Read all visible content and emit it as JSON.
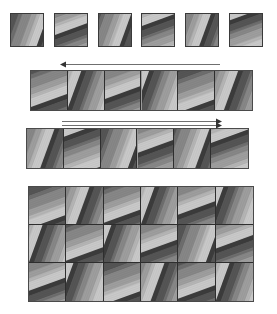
{
  "figure": {
    "background_color": "#ffffff",
    "canvas": {
      "width": 277,
      "height": 314
    },
    "palette": {
      "tile_base": "#8a8a8a",
      "stripe_darkest": "#3c3c3c",
      "stripe_dark": "#555555",
      "stripe_mid_dark": "#6e6e6e",
      "stripe_mid": "#878787",
      "stripe_mid_light": "#9e9e9e",
      "stripe_light": "#b5b5b5",
      "stripe_lightest": "#c9c9c9",
      "tile_border": "#3a3a3a",
      "strip_border": "#4a4a4a",
      "cell_divider": "#2e2e2e",
      "arrow_color": "#6f6f6f"
    },
    "tile_orientations": {
      "shallow_label": "shallow-diagonal",
      "shallow_angle_deg": 20,
      "steep_label": "steep-diagonal",
      "steep_angle_deg": 70
    }
  },
  "rows": [
    {
      "name": "separate-tiles-row",
      "kind": "separate",
      "y": 13,
      "tile_size": 34,
      "count": 6,
      "x_positions": [
        10,
        54,
        98,
        141,
        185,
        229
      ],
      "orientations": [
        "shallow",
        "steep",
        "shallow",
        "steep",
        "shallow",
        "steep"
      ],
      "shade_offsets": [
        0,
        3,
        1,
        4,
        2,
        5
      ]
    },
    {
      "name": "strip-row-upper",
      "kind": "strip",
      "x": 30,
      "y": 70,
      "width": 223,
      "height": 41,
      "count": 6,
      "orientations": [
        "steep",
        "shallow",
        "steep",
        "shallow",
        "steep",
        "shallow"
      ],
      "shade_offsets": [
        1,
        4,
        2,
        5,
        0,
        3
      ]
    },
    {
      "name": "strip-row-lower",
      "kind": "strip",
      "x": 26,
      "y": 128,
      "width": 223,
      "height": 41,
      "count": 6,
      "orientations": [
        "shallow",
        "steep",
        "shallow",
        "steep",
        "shallow",
        "steep"
      ],
      "shade_offsets": [
        2,
        5,
        0,
        3,
        1,
        4
      ]
    },
    {
      "name": "grid-block",
      "kind": "grid",
      "x": 28,
      "y": 186,
      "width": 226,
      "height": 116,
      "cols": 6,
      "grid_rows": 3,
      "orientations": [
        [
          "steep",
          "shallow",
          "steep",
          "shallow",
          "steep",
          "shallow"
        ],
        [
          "shallow",
          "steep",
          "shallow",
          "steep",
          "shallow",
          "steep"
        ],
        [
          "steep",
          "shallow",
          "steep",
          "shallow",
          "steep",
          "shallow"
        ]
      ],
      "shade_offsets": [
        [
          0,
          3,
          1,
          4,
          2,
          5
        ],
        [
          4,
          1,
          5,
          2,
          0,
          3
        ],
        [
          2,
          5,
          0,
          3,
          1,
          4
        ]
      ]
    }
  ],
  "arrows": [
    {
      "name": "arrow-left-above-upper-strip",
      "direction": "left",
      "x": 60,
      "y": 60,
      "length": 160
    },
    {
      "name": "arrow-right-below-upper-strip",
      "direction": "right",
      "x": 62,
      "y": 117,
      "length": 160
    },
    {
      "name": "arrow-right-above-lower-strip",
      "direction": "right",
      "x": 62,
      "y": 121,
      "length": 160
    }
  ]
}
